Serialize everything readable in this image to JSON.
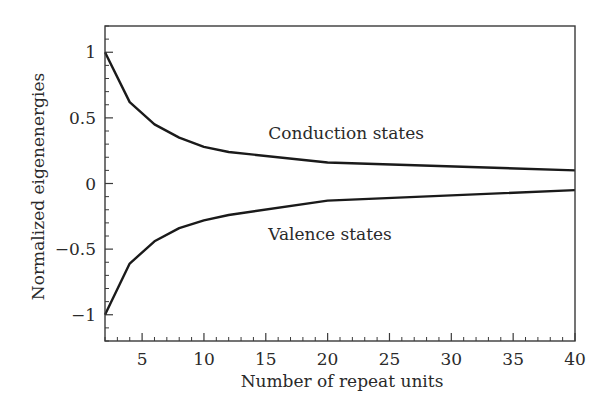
{
  "chart_data": {
    "type": "line",
    "title": "",
    "xlabel": "Number of repeat units",
    "ylabel": "Normalized eigenenergies",
    "xlim": [
      2,
      40
    ],
    "ylim": [
      -1.2,
      1.2
    ],
    "xticks": [
      5,
      10,
      15,
      20,
      25,
      30,
      35,
      40
    ],
    "xtick_labels": [
      "5",
      "10",
      "15",
      "20",
      "25",
      "30",
      "35",
      "40"
    ],
    "yticks": [
      -1,
      -0.5,
      0,
      0.5,
      1
    ],
    "ytick_labels": [
      "−1",
      "−0.5",
      "0",
      "0.5",
      "1"
    ],
    "x_minor_step": 1,
    "y_minor_step": 0.1,
    "grid": false,
    "legend": null,
    "series": [
      {
        "name": "Conduction states",
        "x": [
          2,
          4,
          6,
          8,
          10,
          12,
          20,
          40
        ],
        "values": [
          1.0,
          0.62,
          0.45,
          0.35,
          0.28,
          0.24,
          0.16,
          0.1
        ]
      },
      {
        "name": "Valence states",
        "x": [
          2,
          4,
          6,
          8,
          10,
          12,
          20,
          40
        ],
        "values": [
          -1.0,
          -0.61,
          -0.44,
          -0.34,
          -0.28,
          -0.24,
          -0.13,
          -0.05
        ]
      }
    ],
    "annotations": [
      {
        "text": "Conduction states",
        "x": 15.2,
        "y": 0.34
      },
      {
        "text": "Valence states",
        "x": 15.2,
        "y": -0.43
      }
    ],
    "line_color": "#1a1a1a"
  }
}
